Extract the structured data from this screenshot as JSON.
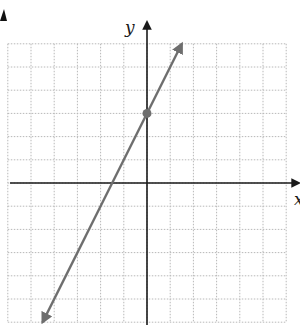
{
  "chart_data": {
    "type": "line",
    "title": "",
    "xlabel": "x",
    "ylabel": "y",
    "xlim": [
      -6,
      6
    ],
    "ylim": [
      -6,
      6
    ],
    "grid": true,
    "grid_step": 1,
    "tick_labels": false,
    "series": [
      {
        "name": "y = 2x + 3",
        "equation": "y = 2x + 3",
        "slope": 2,
        "intercept": 3,
        "x": [
          -4.5,
          1.5
        ],
        "y": [
          -6,
          6
        ],
        "arrows_both_ends": true,
        "color": "#6e6e6e"
      }
    ],
    "points": [
      {
        "label": "y-intercept",
        "x": 0,
        "y": 3,
        "color": "#6e6e6e"
      }
    ],
    "annotations": []
  },
  "labels": {
    "x_axis": "x",
    "y_axis": "y"
  },
  "colors": {
    "axis": "#1a1a1a",
    "grid": "#b8b8b8",
    "line": "#6e6e6e",
    "background": "#ffffff"
  }
}
